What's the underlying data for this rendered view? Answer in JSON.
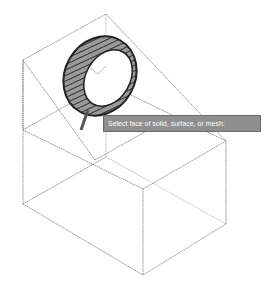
{
  "viewport": {
    "background": "#ffffff",
    "wire_color": "#8a8a8a"
  },
  "tooltip": {
    "text": "Select face of solid, surface, or mesh:",
    "background": "#8f8f8f"
  },
  "model": {
    "type": "wireframe-box-with-wedge",
    "selected_object": "torus-ring"
  }
}
